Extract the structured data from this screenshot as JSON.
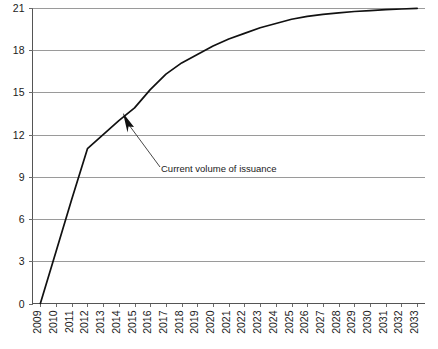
{
  "chart_data": {
    "type": "line",
    "title": "",
    "subtitle": "",
    "xlabel": "",
    "ylabel": "",
    "grid": "horizontal",
    "legend": "none",
    "xlim": [
      2009,
      2033
    ],
    "ylim": [
      0,
      21
    ],
    "y_ticks": [
      "0",
      "3",
      "6",
      "9",
      "12",
      "15",
      "18",
      "21"
    ],
    "y_tick_values": [
      0,
      3,
      6,
      9,
      12,
      15,
      18,
      21
    ],
    "categories": [
      "2009",
      "2010",
      "2011",
      "2012",
      "2013",
      "2014",
      "2015",
      "2016",
      "2017",
      "2018",
      "2019",
      "2020",
      "2021",
      "2022",
      "2023",
      "2024",
      "2025",
      "2026",
      "2027",
      "2028",
      "2029",
      "2030",
      "2031",
      "2032",
      "2033"
    ],
    "series": [
      {
        "name": "Cumulative volume of issuance",
        "color": "#111111",
        "values": [
          0.0,
          3.7,
          7.4,
          11.0,
          12.0,
          13.0,
          13.9,
          15.2,
          16.3,
          17.1,
          17.7,
          18.3,
          18.8,
          19.2,
          19.6,
          19.9,
          20.2,
          20.4,
          20.55,
          20.65,
          20.75,
          20.82,
          20.88,
          20.93,
          20.98
        ]
      }
    ],
    "annotations": [
      {
        "text": "Current volume of issuance",
        "points_to_x": "2015",
        "points_to_value": 13.9
      }
    ],
    "colors": {
      "gridline": "#9a9a9a",
      "axis": "#555555",
      "series": "#111111",
      "annotation": "#333333",
      "background": "#ffffff"
    }
  }
}
